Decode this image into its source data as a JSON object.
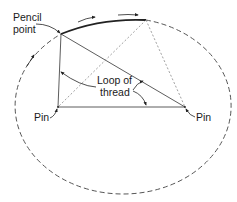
{
  "diagram": {
    "labels": {
      "pencil_point_line1": "Pencil",
      "pencil_point_line2": "point",
      "loop_line1": "Loop of",
      "loop_line2": "thread",
      "pin_left": "Pin",
      "pin_right": "Pin"
    },
    "points": {
      "pencil": [
        61,
        34
      ],
      "alt_pencil": [
        146,
        20
      ],
      "pin_left": [
        58,
        107
      ],
      "pin_right": [
        185,
        107
      ]
    },
    "ellipse": {
      "cx": 121,
      "cy": 107,
      "rx": 108,
      "ry": 88
    },
    "colors": {
      "line": "#333333",
      "dashed": "#555555",
      "text": "#1a1a1a",
      "background": "#ffffff"
    }
  }
}
